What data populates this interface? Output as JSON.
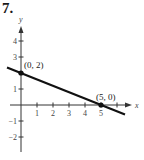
{
  "problem_number": "7.",
  "chart_data": {
    "type": "line",
    "title": "7.",
    "xlabel": "x",
    "ylabel": "y",
    "xlim": [
      -1,
      6.5
    ],
    "ylim": [
      -3,
      5
    ],
    "x_ticks": [
      1,
      2,
      3,
      4,
      5,
      6
    ],
    "x_tick_labels": [
      "1",
      "2",
      "3",
      "4",
      "5",
      ""
    ],
    "y_ticks": [
      -2,
      -1,
      1,
      2,
      3,
      4
    ],
    "y_tick_labels": [
      "−2",
      "−1",
      "1",
      "",
      "3",
      "4"
    ],
    "grid": false,
    "series": [
      {
        "name": "line",
        "x": [
          -0.875,
          6.5
        ],
        "y": [
          2.35,
          -0.6
        ],
        "equation": "y = -0.4x + 2"
      }
    ],
    "points": [
      {
        "x": 0,
        "y": 2,
        "label": "(0, 2)"
      },
      {
        "x": 5,
        "y": 0,
        "label": "(5, 0)"
      }
    ],
    "colors": {
      "line": "#111111",
      "axis": "#333333"
    }
  }
}
